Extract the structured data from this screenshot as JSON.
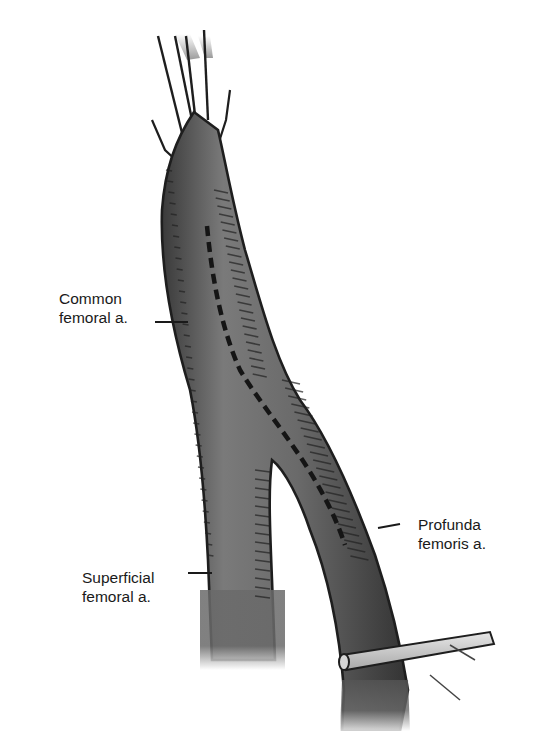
{
  "figure": {
    "colors": {
      "vessel_fill": "#6e6e6e",
      "vessel_outline": "#1e1e1e",
      "incision_line": "#151515",
      "background": "#ffffff",
      "vessel_loop": "#c8c8c8"
    }
  },
  "labels": {
    "common": {
      "line1": "Common",
      "line2": "femoral a."
    },
    "superficial": {
      "line1": "Superficial",
      "line2": "femoral a."
    },
    "profunda": {
      "line1": "Profunda",
      "line2": "femoris a."
    }
  }
}
